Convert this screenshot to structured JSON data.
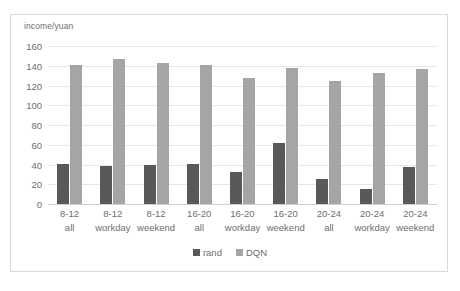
{
  "chart_data": {
    "type": "bar",
    "title": "",
    "subtitle": "",
    "xlabel": "",
    "ylabel": "income/yuan",
    "ylim": [
      0,
      160
    ],
    "ytick_values": [
      0,
      20,
      40,
      60,
      80,
      100,
      120,
      140,
      160
    ],
    "ytick_labels": [
      "0",
      "20",
      "40",
      "60",
      "80",
      "100",
      "120",
      "140",
      "160"
    ],
    "grid": true,
    "legend_position": "bottom-center",
    "categories": [
      "8-12 all",
      "8-12 workday",
      "8-12 weekend",
      "16-20 all",
      "16-20 workday",
      "16-20 weekend",
      "20-24 all",
      "20-24 workday",
      "20-24 weekend"
    ],
    "category_lines": [
      {
        "line1": "8-12",
        "line2": "all"
      },
      {
        "line1": "8-12",
        "line2": "workday"
      },
      {
        "line1": "8-12",
        "line2": "weekend"
      },
      {
        "line1": "16-20",
        "line2": "all"
      },
      {
        "line1": "16-20",
        "line2": "workday"
      },
      {
        "line1": "16-20",
        "line2": "weekend"
      },
      {
        "line1": "20-24",
        "line2": "all"
      },
      {
        "line1": "20-24",
        "line2": "workday"
      },
      {
        "line1": "20-24",
        "line2": "weekend"
      }
    ],
    "series": [
      {
        "name": "rand",
        "color": "#595959",
        "values": [
          41,
          38,
          40,
          41,
          32,
          62,
          25,
          15,
          37
        ]
      },
      {
        "name": "DQN",
        "color": "#a5a5a5",
        "values": [
          141,
          147,
          143,
          141,
          128,
          138,
          125,
          133,
          137
        ]
      }
    ]
  },
  "legend": {
    "items": [
      {
        "label": "rand",
        "color": "#595959"
      },
      {
        "label": "DQN",
        "color": "#a5a5a5"
      }
    ]
  },
  "colors": {
    "rand": "#595959",
    "dqn": "#a5a5a5",
    "gridline": "#e6e6e6",
    "axis_text": "#6e6e6e",
    "frame_border": "#d9d9d9",
    "background": "#ffffff"
  }
}
